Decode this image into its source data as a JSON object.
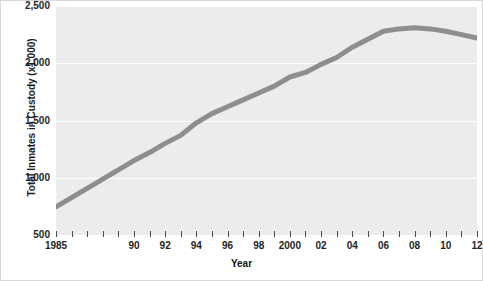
{
  "figure": {
    "background_color": "#ffffff",
    "panel_color": "#ececec",
    "gridline_color": "#ffffff",
    "line_color": "#8e8e8e"
  },
  "axes": {
    "y_title": "Total Inmates in Custody (x1,000)",
    "x_title": "Year",
    "y_ticks": [
      "500",
      "1,000",
      "1,500",
      "2,000",
      "2,500"
    ],
    "x_tick_labels": [
      "1985",
      "90",
      "92",
      "94",
      "96",
      "98",
      "2000",
      "02",
      "04",
      "06",
      "08",
      "10",
      "12"
    ]
  },
  "chart_data": {
    "type": "line",
    "title": "",
    "subtitle": "",
    "xlabel": "Year",
    "ylabel": "Total Inmates in Custody (x1,000)",
    "xlim": [
      1985,
      2012
    ],
    "ylim": [
      500,
      2500
    ],
    "yticks": [
      500,
      1000,
      1500,
      2000,
      2500
    ],
    "ytick_labels": [
      "500",
      "1,000",
      "1,500",
      "2,000",
      "2,500"
    ],
    "xticks": [
      1985,
      1986,
      1987,
      1988,
      1989,
      1990,
      1991,
      1992,
      1993,
      1994,
      1995,
      1996,
      1997,
      1998,
      1999,
      2000,
      2001,
      2002,
      2003,
      2004,
      2005,
      2006,
      2007,
      2008,
      2009,
      2010,
      2011,
      2012
    ],
    "xtick_labels": [
      "1985",
      "",
      "",
      "",
      "",
      "90",
      "",
      "92",
      "",
      "94",
      "",
      "96",
      "",
      "98",
      "",
      "2000",
      "",
      "02",
      "",
      "04",
      "",
      "06",
      "",
      "08",
      "",
      "10",
      "",
      "12"
    ],
    "grid": "horizontal",
    "legend": "none",
    "line_color": "#8e8e8e",
    "line_width": 5,
    "x": [
      1985,
      1990,
      1991,
      1992,
      1993,
      1994,
      1995,
      1996,
      1997,
      1998,
      1999,
      2000,
      2001,
      2002,
      2003,
      2004,
      2005,
      2006,
      2007,
      2008,
      2009,
      2010,
      2011,
      2012
    ],
    "values": [
      745,
      1150,
      1220,
      1300,
      1370,
      1480,
      1560,
      1620,
      1680,
      1740,
      1800,
      1880,
      1920,
      1990,
      2050,
      2140,
      2210,
      2280,
      2300,
      2310,
      2300,
      2280,
      2250,
      2220
    ],
    "series": [
      {
        "name": "Total Inmates in Custody",
        "values": [
          745,
          1150,
          1220,
          1300,
          1370,
          1480,
          1560,
          1620,
          1680,
          1740,
          1800,
          1880,
          1920,
          1990,
          2050,
          2140,
          2210,
          2280,
          2300,
          2310,
          2300,
          2280,
          2250,
          2220
        ]
      }
    ]
  }
}
